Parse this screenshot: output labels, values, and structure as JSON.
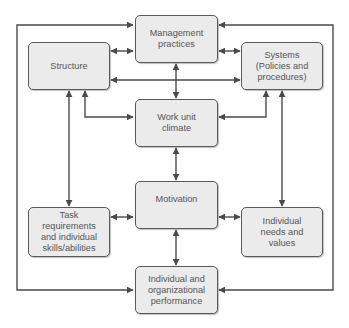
{
  "diagram": {
    "type": "organizational-model flow diagram",
    "line_color": "#4a4a4a",
    "box_fill": "#ebebeb",
    "nodes": {
      "management": {
        "label": "Management\npractices"
      },
      "structure": {
        "label": "Structure"
      },
      "systems": {
        "label": "Systems\n(Policies and\nprocedures)"
      },
      "climate": {
        "label": "Work unit\nclimate"
      },
      "motivation": {
        "label": "Motivation"
      },
      "task": {
        "label": "Task\nrequirements\nand individual\nskills/abilities"
      },
      "needs": {
        "label": "Individual\nneeds and\nvalues"
      },
      "performance": {
        "label": "Individual and\norganizational\nperformance"
      }
    },
    "edges": [
      {
        "from": "structure",
        "to": "management",
        "direction": "both"
      },
      {
        "from": "management",
        "to": "systems",
        "direction": "both"
      },
      {
        "from": "structure",
        "to": "systems",
        "direction": "both"
      },
      {
        "from": "management",
        "to": "climate",
        "direction": "both"
      },
      {
        "from": "structure",
        "to": "climate",
        "direction": "both"
      },
      {
        "from": "systems",
        "to": "climate",
        "direction": "both"
      },
      {
        "from": "structure",
        "to": "task",
        "direction": "both"
      },
      {
        "from": "systems",
        "to": "needs",
        "direction": "both"
      },
      {
        "from": "climate",
        "to": "motivation",
        "direction": "both"
      },
      {
        "from": "task",
        "to": "motivation",
        "direction": "both"
      },
      {
        "from": "motivation",
        "to": "needs",
        "direction": "both"
      },
      {
        "from": "motivation",
        "to": "performance",
        "direction": "both"
      },
      {
        "from": "performance",
        "to": "management",
        "direction": "forward",
        "route": "outer-left-loop"
      },
      {
        "from": "performance",
        "to": "management",
        "direction": "forward",
        "route": "outer-right-loop"
      }
    ]
  }
}
